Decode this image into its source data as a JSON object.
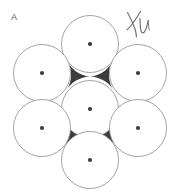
{
  "figure": {
    "panel_label": "A",
    "handwritten_annotation": "XU",
    "background_color": "#ffffff",
    "circle_fill_color": "#ffffff",
    "circle_stroke_color": "#9a9a9c",
    "circle_stroke_width": 0.9,
    "void_color": "#3c3c3e",
    "center_dot_color": "#3a3a3c",
    "center_dot_radius": 2.1,
    "label_color": "#59595b",
    "annotation_color": "#6e6e70",
    "width": 185,
    "height": 194
  },
  "chart_data": {
    "type": "scatter",
    "title": "A",
    "xlabel": "",
    "ylabel": "",
    "xlim": [
      0,
      185
    ],
    "ylim": [
      0,
      194
    ],
    "grid": false,
    "legend": null,
    "circle_radius": 28.5,
    "packing": "hexagonal-close-packed",
    "circle_count": 7,
    "series": [
      {
        "name": "circle centers",
        "points": [
          {
            "id": "center",
            "x": 90,
            "y": 109
          },
          {
            "id": "top",
            "x": 90,
            "y": 44
          },
          {
            "id": "upper-left",
            "x": 42,
            "y": 73
          },
          {
            "id": "upper-right",
            "x": 138,
            "y": 73
          },
          {
            "id": "lower-left",
            "x": 42,
            "y": 128
          },
          {
            "id": "lower-right",
            "x": 138,
            "y": 128
          },
          {
            "id": "bottom",
            "x": 90,
            "y": 160
          }
        ]
      }
    ],
    "voids": [
      {
        "id": "void-upper-left",
        "x": 64,
        "y": 78
      },
      {
        "id": "void-upper-right",
        "x": 117,
        "y": 78
      },
      {
        "id": "void-lower-left",
        "x": 64,
        "y": 133
      },
      {
        "id": "void-lower-right",
        "x": 117,
        "y": 133
      }
    ],
    "annotations": [
      {
        "id": "panel-label",
        "text": "A",
        "x": 14,
        "y": 20
      },
      {
        "id": "handwritten-mark",
        "text": "XU",
        "x": 134,
        "y": 26
      }
    ]
  }
}
